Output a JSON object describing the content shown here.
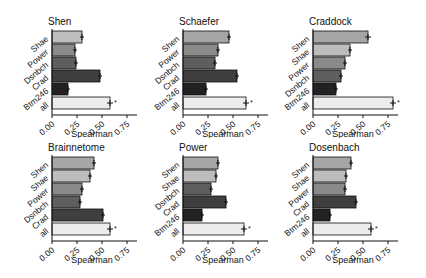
{
  "chart_data": [
    {
      "type": "bar",
      "orientation": "horizontal",
      "title": "Shen",
      "xlabel": "Spearman",
      "xlim": [
        0,
        0.85
      ],
      "xticks": [
        "0.00",
        "0.25",
        "0.50",
        "0.75"
      ],
      "categories": [
        "Shae",
        "Power",
        "Dsnbch",
        "Crad",
        "Btm246",
        "all"
      ],
      "values": [
        0.3,
        0.23,
        0.24,
        0.48,
        0.16,
        0.58
      ],
      "errors": [
        0.02,
        0.02,
        0.02,
        0.02,
        0.02,
        0.03
      ],
      "significance": [
        "",
        "",
        "",
        "",
        "",
        "*"
      ]
    },
    {
      "type": "bar",
      "orientation": "horizontal",
      "title": "Schaefer",
      "xlabel": "Spearman",
      "xlim": [
        0,
        0.85
      ],
      "xticks": [
        "0.00",
        "0.25",
        "0.50",
        "0.75"
      ],
      "categories": [
        "Shen",
        "Power",
        "Dsnbch",
        "Crad",
        "Btm246",
        "all"
      ],
      "values": [
        0.46,
        0.35,
        0.32,
        0.54,
        0.23,
        0.63
      ],
      "errors": [
        0.02,
        0.02,
        0.02,
        0.02,
        0.02,
        0.03
      ],
      "significance": [
        "",
        "",
        "",
        "",
        "",
        "*"
      ]
    },
    {
      "type": "bar",
      "orientation": "horizontal",
      "title": "Craddock",
      "xlabel": "Spearman",
      "xlim": [
        0,
        0.85
      ],
      "xticks": [
        "0.00",
        "0.25",
        "0.50",
        "0.75"
      ],
      "categories": [
        "Shen",
        "Shae",
        "Power",
        "Dsnbch",
        "Btm246",
        "all"
      ],
      "values": [
        0.55,
        0.37,
        0.32,
        0.28,
        0.23,
        0.8
      ],
      "errors": [
        0.03,
        0.02,
        0.02,
        0.02,
        0.02,
        0.03
      ],
      "significance": [
        "",
        "",
        "",
        "",
        "",
        "*"
      ]
    },
    {
      "type": "bar",
      "orientation": "horizontal",
      "title": "Brainnetome",
      "xlabel": "Spearman",
      "xlim": [
        0,
        0.85
      ],
      "xticks": [
        "0.00",
        "0.25",
        "0.50",
        "0.75"
      ],
      "categories": [
        "Shen",
        "Shae",
        "Power",
        "Dsnbch",
        "Crad",
        "all"
      ],
      "values": [
        0.42,
        0.38,
        0.3,
        0.28,
        0.51,
        0.58
      ],
      "errors": [
        0.02,
        0.02,
        0.02,
        0.02,
        0.02,
        0.03
      ],
      "significance": [
        "",
        "",
        "",
        "",
        "",
        "*"
      ]
    },
    {
      "type": "bar",
      "orientation": "horizontal",
      "title": "Power",
      "xlabel": "Spearman",
      "xlim": [
        0,
        0.85
      ],
      "xticks": [
        "0.00",
        "0.25",
        "0.50",
        "0.75"
      ],
      "categories": [
        "Shen",
        "Shae",
        "Dsnbch",
        "Crad",
        "Btm246",
        "all"
      ],
      "values": [
        0.35,
        0.33,
        0.28,
        0.43,
        0.19,
        0.61
      ],
      "errors": [
        0.02,
        0.02,
        0.02,
        0.02,
        0.02,
        0.03
      ],
      "significance": [
        "",
        "",
        "",
        "",
        "",
        "*"
      ]
    },
    {
      "type": "bar",
      "orientation": "horizontal",
      "title": "Dosenbach",
      "xlabel": "Spearman",
      "xlim": [
        0,
        0.85
      ],
      "xticks": [
        "0.00",
        "0.25",
        "0.50",
        "0.75"
      ],
      "categories": [
        "Shen",
        "Shae",
        "Power",
        "Crad",
        "Btm246",
        "all"
      ],
      "values": [
        0.38,
        0.33,
        0.32,
        0.43,
        0.17,
        0.58
      ],
      "errors": [
        0.02,
        0.02,
        0.02,
        0.02,
        0.02,
        0.03
      ],
      "significance": [
        "",
        "",
        "",
        "",
        "",
        "*"
      ]
    }
  ],
  "colors": {
    "Shen": "#a6a6a6",
    "Shae": "#bdbdbd",
    "Power": "#8a8a8a",
    "Dsnbch": "#5e5e5e",
    "Crad": "#3f3f3f",
    "Btm246": "#222222",
    "all": "#ececec",
    "outline": "#111111",
    "axis": "#111111"
  }
}
